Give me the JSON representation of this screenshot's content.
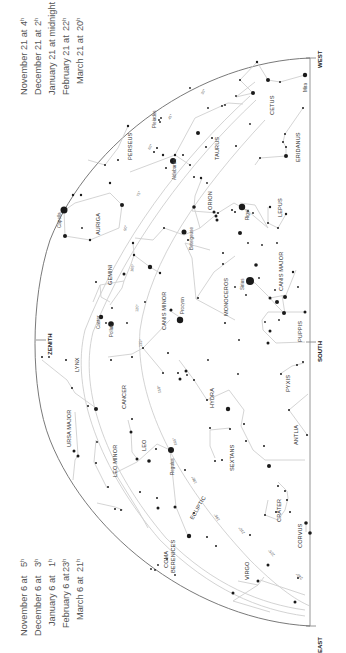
{
  "times_left": [
    {
      "date": "November 6 at",
      "time": "5",
      "unit": "h"
    },
    {
      "date": "December 6 at",
      "time": "3",
      "unit": "h"
    },
    {
      "date": "January 6 at",
      "time": "1",
      "unit": "h"
    },
    {
      "date": "February 6 at",
      "time": "23",
      "unit": "h"
    },
    {
      "date": "March 6 at",
      "time": "21",
      "unit": "h"
    }
  ],
  "times_right": [
    {
      "date": "November 21 at",
      "time": "4",
      "unit": "h"
    },
    {
      "date": "December 21 at",
      "time": "2",
      "unit": "h"
    },
    {
      "date": "January 21 at midnight",
      "time": "",
      "unit": ""
    },
    {
      "date": "February 21 at",
      "time": "22",
      "unit": "h"
    },
    {
      "date": "March 21 at",
      "time": "20",
      "unit": "h"
    }
  ],
  "cardinals": {
    "zenith": "ZENITH",
    "south": "SOUTH",
    "east": "EAST",
    "west": "WEST"
  },
  "constellations": {
    "cetus": "CETUS",
    "eridanus": "ERIDANUS",
    "taurus": "TAURUS",
    "perseus": "PERSEUS",
    "auriga": "AURIGA",
    "orion": "ORION",
    "lepus": "LEPUS",
    "gemini": "GEMINI",
    "canis_minor": "CANIS MINOR",
    "monoceros": "MONOCEROS",
    "canis_major": "CANIS MAJOR",
    "puppis": "PUPPIS",
    "lynx": "LYNX",
    "cancer": "CANCER",
    "hydra": "HYDRA",
    "pyxis": "PYXIS",
    "ursa_major": "URSA MAJOR",
    "leo_minor": "LEO MINOR",
    "leo": "LEO",
    "sextans": "SEXTANS",
    "antlia": "ANTLIA",
    "crater": "CRATER",
    "corvus": "CORVUS",
    "virgo": "VIRGO",
    "coma1": "COMA",
    "coma2": "BERENICES",
    "ecliptic": "ECLIPTIC"
  },
  "stars": {
    "mira": "Mira",
    "pleiades": "Pleiades",
    "aldebaran": "Aldebaran",
    "capella": "Capella",
    "betelgeuse": "Betelgeuse",
    "rigel": "Rigel",
    "sirius": "Sirius",
    "procyon": "Procyon",
    "castor": "Castor",
    "pollux": "Pollux",
    "regulus": "Regulus"
  },
  "ecliptic_ticks": [
    "0h",
    "2h",
    "4h",
    "6h",
    "8h",
    "10h",
    "12h",
    "14h",
    "16h",
    "18h",
    "20h",
    "22h"
  ],
  "ecliptic_degrees": [
    "30°",
    "45°",
    "60°",
    "75°",
    "90°",
    "105°",
    "120°",
    "135°",
    "150°",
    "165°",
    "180°",
    "195°",
    "210°",
    "225°",
    "240°"
  ],
  "colors": {
    "dome": "#6a6a6a",
    "lines": "#cfcfcf",
    "stars": "#1a1a1a",
    "text": "#555555"
  }
}
